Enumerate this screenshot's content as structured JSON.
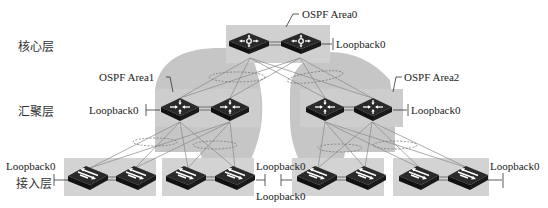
{
  "layers": {
    "core": "核心层",
    "aggregation": "汇聚层",
    "access": "接入层"
  },
  "areas": {
    "area0": "OSPF Area0",
    "area1": "OSPF Area1",
    "area2": "OSPF Area2"
  },
  "loopbacks": {
    "core": "Loopback0",
    "agg_left": "Loopback0",
    "agg_right": "Loopback0",
    "access1": "Loopback0",
    "access2": "Loopback0",
    "access3": "Loopback0",
    "access4": "Loopback0"
  },
  "devices": {
    "core": [
      "core-switch-1",
      "core-switch-2"
    ],
    "aggregation": [
      "agg-switch-1",
      "agg-switch-2",
      "agg-switch-3",
      "agg-switch-4"
    ],
    "access": [
      "access-switch-1",
      "access-switch-2",
      "access-switch-3",
      "access-switch-4",
      "access-switch-5",
      "access-switch-6",
      "access-switch-7",
      "access-switch-8"
    ]
  },
  "colors": {
    "box_fill": "#cfcfcf",
    "area_fill": "#c4c4c4",
    "device": "#1e1e1e",
    "line": "#888888"
  }
}
